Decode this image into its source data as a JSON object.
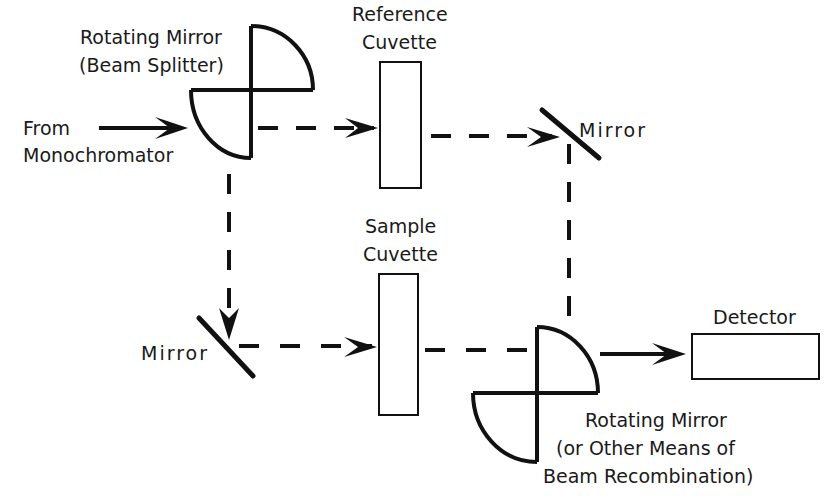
{
  "diagram": {
    "type": "double-beam spectrophotometer optical path",
    "components": {
      "splitter": {
        "label_line1": "Rotating Mirror",
        "label_line2": "(Beam Splitter)"
      },
      "source": {
        "label_line1": "From",
        "label_line2": "Monochromator"
      },
      "reference_cuvette": {
        "label_line1": "Reference",
        "label_line2": "Cuvette"
      },
      "mirror_top": {
        "label": "Mirror"
      },
      "mirror_bottom": {
        "label": "Mirror"
      },
      "sample_cuvette": {
        "label_line1": "Sample",
        "label_line2": "Cuvette"
      },
      "detector": {
        "label": "Detector"
      },
      "combiner": {
        "label_line1": "Rotating Mirror",
        "label_line2": "(or Other Means of",
        "label_line3": "Beam Recombination)"
      }
    },
    "beams": [
      {
        "from": "Monochromator",
        "to": "Rotating Mirror (Beam Splitter)",
        "style": "solid"
      },
      {
        "from": "Rotating Mirror (Beam Splitter)",
        "to": "Reference Cuvette",
        "style": "dashed"
      },
      {
        "from": "Reference Cuvette",
        "to": "Mirror (top)",
        "style": "dashed"
      },
      {
        "from": "Mirror (top)",
        "to": "Rotating Mirror (Recombination)",
        "style": "dashed"
      },
      {
        "from": "Rotating Mirror (Beam Splitter)",
        "to": "Mirror (bottom)",
        "style": "dashed"
      },
      {
        "from": "Mirror (bottom)",
        "to": "Sample Cuvette",
        "style": "dashed"
      },
      {
        "from": "Sample Cuvette",
        "to": "Rotating Mirror (Recombination)",
        "style": "dashed"
      },
      {
        "from": "Rotating Mirror (Recombination)",
        "to": "Detector",
        "style": "solid"
      }
    ],
    "colors": {
      "ink": "#111111",
      "background": "#ffffff"
    }
  }
}
